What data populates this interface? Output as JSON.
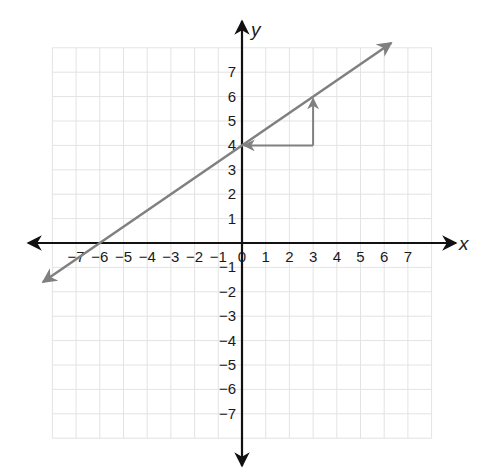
{
  "chart_data": {
    "type": "line",
    "title": "",
    "xlabel": "x",
    "ylabel": "y",
    "xlim": [
      -8,
      8
    ],
    "ylim": [
      -8,
      8
    ],
    "grid": true,
    "x_ticks": [
      -7,
      -6,
      -5,
      -4,
      -3,
      -2,
      -1,
      0,
      1,
      2,
      3,
      4,
      5,
      6,
      7
    ],
    "y_ticks": [
      7,
      6,
      5,
      4,
      3,
      2,
      1,
      -1,
      -2,
      -3,
      -4,
      -5,
      -6,
      -7
    ],
    "x_tick_labels": [
      "−7",
      "−6",
      "−5",
      "−4",
      "−3",
      "−2",
      "−1",
      "0",
      "1",
      "2",
      "3",
      "4",
      "5",
      "6",
      "7"
    ],
    "y_tick_labels": [
      "7",
      "6",
      "5",
      "4",
      "3",
      "2",
      "1",
      "−1",
      "−2",
      "−3",
      "−4",
      "−5",
      "−6",
      "−7"
    ],
    "series": [
      {
        "name": "line",
        "equation": "y = (2/3)x + 4",
        "slope": 0.6667,
        "intercept": 4,
        "x_intercept": -6,
        "arrows": "both",
        "endpoints": [
          [
            -8.4,
            -1.6
          ],
          [
            6.3,
            8.2
          ]
        ],
        "color": "#808080"
      }
    ],
    "annotations": [
      {
        "type": "slope-triangle-run",
        "from": [
          3,
          4
        ],
        "to": [
          0,
          4
        ],
        "arrow_at": [
          0,
          4
        ],
        "color": "#808080"
      },
      {
        "type": "slope-triangle-rise",
        "from": [
          3,
          4
        ],
        "to": [
          3,
          6
        ],
        "arrow_at": [
          3,
          6
        ],
        "color": "#808080"
      }
    ]
  },
  "colors": {
    "axis": "#111111",
    "grid": "#e3e3e3",
    "line": "#808080"
  }
}
